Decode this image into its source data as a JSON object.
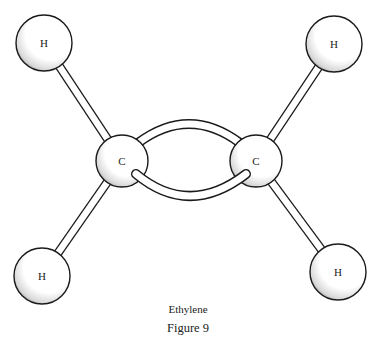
{
  "molecule": {
    "name": "Ethylene",
    "figure_label": "Figure 9",
    "atoms": [
      {
        "id": "h1",
        "symbol": "H",
        "cx": 44,
        "cy": 43,
        "r": 28
      },
      {
        "id": "h2",
        "symbol": "H",
        "cx": 334,
        "cy": 44,
        "r": 28
      },
      {
        "id": "c1",
        "symbol": "C",
        "cx": 122,
        "cy": 161,
        "r": 26
      },
      {
        "id": "c2",
        "symbol": "C",
        "cx": 256,
        "cy": 161,
        "r": 26
      },
      {
        "id": "h3",
        "symbol": "H",
        "cx": 42,
        "cy": 276,
        "r": 28
      },
      {
        "id": "h4",
        "symbol": "H",
        "cx": 338,
        "cy": 272,
        "r": 28
      }
    ],
    "bonds": [
      {
        "from": "c1",
        "to": "h1",
        "type": "single"
      },
      {
        "from": "c1",
        "to": "h3",
        "type": "single"
      },
      {
        "from": "c2",
        "to": "h2",
        "type": "single"
      },
      {
        "from": "c2",
        "to": "h4",
        "type": "single"
      },
      {
        "from": "c1",
        "to": "c2",
        "type": "double"
      }
    ],
    "colors": {
      "outline": "#1a1a1a",
      "fill": "#ffffff",
      "shade": "#9a9a9a"
    }
  }
}
